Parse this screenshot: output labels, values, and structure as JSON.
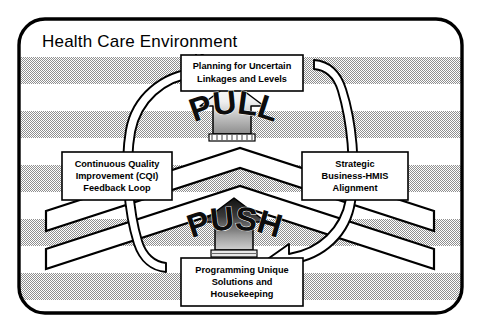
{
  "diagram": {
    "title": "Health Care Environment",
    "type": "cycle-diagram",
    "background_pattern": "horizontal-gray-stripes",
    "colors": {
      "border": "#000000",
      "stripe_gray": "#bfbfbf",
      "stripe_white": "#ffffff",
      "box_fill": "#ffffff",
      "text": "#000000",
      "arrow_white_fill": "#ffffff",
      "pull_arrow_top": "#ffffff",
      "pull_arrow_bottom": "#8a8a8a",
      "push_arrow_top": "#0d0d0d",
      "push_arrow_bottom": "#bdbdbd"
    },
    "boxes": [
      {
        "id": "top",
        "name": "planning-box",
        "lines": [
          "Planning for Uncertain",
          "Linkages and Levels"
        ]
      },
      {
        "id": "left",
        "name": "cqi-box",
        "lines": [
          "Continuous Quality",
          "Improvement (CQI)",
          "Feedback Loop"
        ]
      },
      {
        "id": "right",
        "name": "alignment-box",
        "lines": [
          "Strategic",
          "Business-HMIS",
          "Alignment"
        ]
      },
      {
        "id": "bottom",
        "name": "programming-box",
        "lines": [
          "Programming Unique",
          "Solutions and",
          "Housekeeping"
        ]
      }
    ],
    "flow_words": [
      {
        "id": "pull",
        "label": "PULL",
        "direction": "up",
        "arrow": "gradient-up-arrow-light"
      },
      {
        "id": "push",
        "label": "PUSH",
        "direction": "up",
        "arrow": "gradient-up-arrow-dark"
      }
    ],
    "cycle_arrows": [
      {
        "id": "left-up",
        "name": "counterclockwise-ribbon-arrow-upper-left",
        "points_to": "planning-box"
      },
      {
        "id": "right-down",
        "name": "counterclockwise-ribbon-arrow-lower-right",
        "points_to": "programming-box"
      }
    ],
    "chevrons": [
      {
        "id": "upper-chevron",
        "name": "upper-chevron-band"
      },
      {
        "id": "lower-chevron",
        "name": "lower-chevron-band"
      }
    ]
  }
}
